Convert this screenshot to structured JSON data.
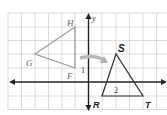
{
  "diagram": {
    "type": "coordinate-plane-transformation",
    "axes": {
      "x_label": "x",
      "y_label": "y",
      "axis_color": "#222222",
      "grid_color": "#cfcfcf"
    },
    "preimage": {
      "name": "triangle GHF",
      "vertices": [
        {
          "label": "H",
          "px": [
            75,
            27
          ]
        },
        {
          "label": "G",
          "px": [
            35,
            54
          ]
        },
        {
          "label": "F",
          "px": [
            75,
            68
          ]
        }
      ],
      "color": "#9a9a9a"
    },
    "image": {
      "name": "triangle RST",
      "vertices": [
        {
          "label": "S",
          "px": [
            116,
            54
          ]
        },
        {
          "label": "R",
          "px": [
            102,
            96
          ]
        },
        {
          "label": "T",
          "px": [
            143,
            96
          ]
        }
      ],
      "color": "#333333"
    },
    "annotations": {
      "angle_1": "1",
      "angle_2": "2"
    },
    "arrow": {
      "meaning": "transformation-arrow",
      "color": "#b0b0b0"
    }
  }
}
